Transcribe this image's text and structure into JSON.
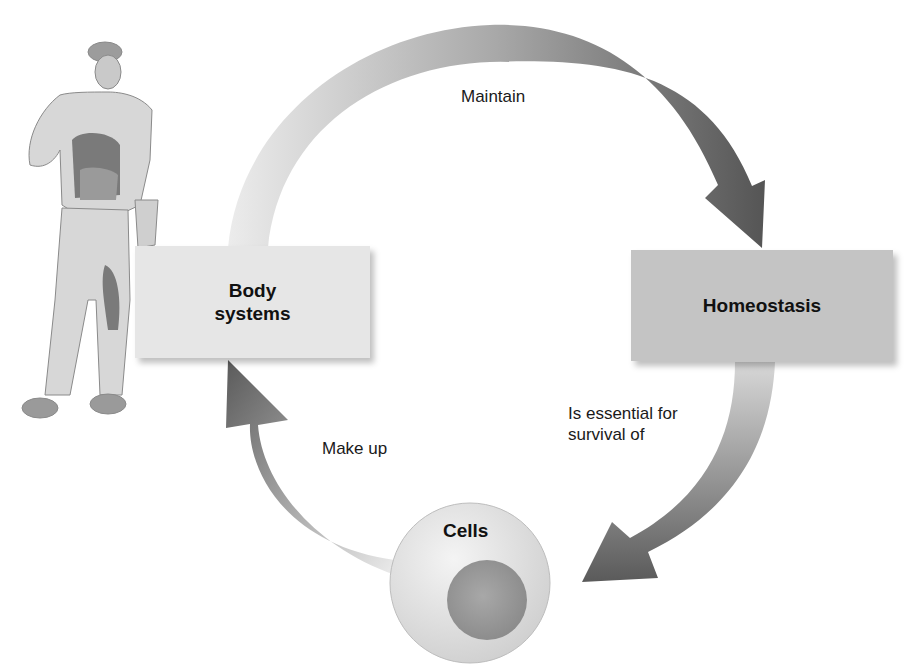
{
  "diagram": {
    "nodes": {
      "body_systems": {
        "line1": "Body",
        "line2": "systems"
      },
      "homeostasis": {
        "label": "Homeostasis"
      },
      "cells": {
        "label": "Cells"
      }
    },
    "edges": [
      {
        "from": "Body systems",
        "to": "Homeostasis",
        "label": "Maintain"
      },
      {
        "from": "Homeostasis",
        "to": "Cells",
        "label_line1": "Is essential for",
        "label_line2": "survival of"
      },
      {
        "from": "Cells",
        "to": "Body systems",
        "label": "Make up"
      }
    ],
    "illustration": "human-figure-anatomy",
    "colors": {
      "arrow_light": "#e4e4e4",
      "arrow_dark": "#555555",
      "body_box": "#e6e6e6",
      "homeostasis_box": "#c4c4c4",
      "cell_membrane": "#dcdcdc",
      "nucleus": "#9a9a9a"
    }
  }
}
